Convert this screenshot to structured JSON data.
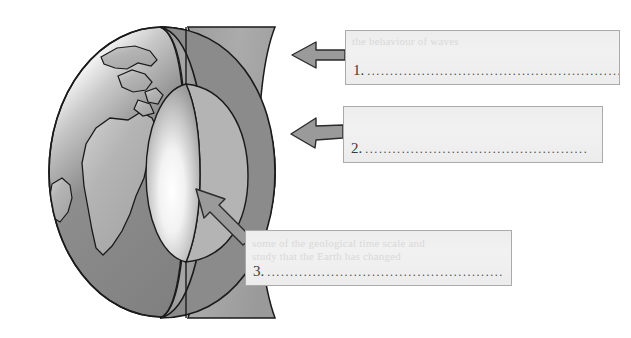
{
  "document": {
    "type": "worksheet-diagram",
    "title": "Earth's interior cutaway labelling exercise",
    "background_color": "#ffffff"
  },
  "diagram": {
    "name": "earth-cutaway",
    "colors": {
      "ocean": "#8c8c8c",
      "continent": "#b0b0b0",
      "outline": "#1a1a1a",
      "crust_band": "#9a9a9a",
      "mantle_face": "#a8a8a8",
      "core_light": "#fbfbfb",
      "core_dark": "#9d9d9d",
      "arrow_fill": "#9a9a9a",
      "arrow_outline": "#2b2b2b"
    },
    "layers": [
      {
        "name": "crust",
        "target_label": "1"
      },
      {
        "name": "mantle",
        "target_label": "2"
      },
      {
        "name": "core",
        "target_label": "3"
      }
    ]
  },
  "arrows": [
    {
      "name": "arrow-to-crust",
      "points_to": "crust",
      "direction": "left",
      "from_box": "1"
    },
    {
      "name": "arrow-to-mantle",
      "points_to": "mantle",
      "direction": "left",
      "from_box": "2"
    },
    {
      "name": "arrow-to-core",
      "points_to": "core",
      "direction": "up-left",
      "from_box": "3"
    }
  ],
  "answer_boxes": [
    {
      "id": "box1",
      "number": "1.",
      "value": "",
      "placeholder": "",
      "dots": "........................................................",
      "ghost_text": "the behaviour of waves"
    },
    {
      "id": "box2",
      "number": "2.",
      "value": "",
      "placeholder": "",
      "dots": ".................................................",
      "ghost_text": ""
    },
    {
      "id": "box3",
      "number": "3.",
      "value": "",
      "placeholder": "",
      "dots": "....................................................",
      "ghost_text": "some of the geological time scale and\nstudy that the Earth has changed"
    }
  ]
}
